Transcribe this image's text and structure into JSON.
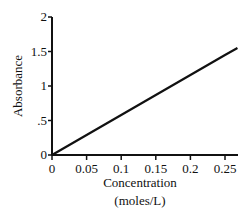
{
  "chart_data": {
    "type": "line",
    "title": "",
    "xlabel": "Concentration (moles/L)",
    "xlabel_lines": [
      "Concentration",
      "(moles/L)"
    ],
    "ylabel": "Absorbance",
    "xlim": [
      0,
      0.27
    ],
    "ylim": [
      0,
      2
    ],
    "x_ticks": [
      0,
      0.05,
      0.1,
      0.15,
      0.2,
      0.25
    ],
    "x_tick_labels": [
      "0",
      "0.05",
      "0.1",
      "0.15",
      "0.2",
      "0.25"
    ],
    "y_ticks": [
      0,
      0.5,
      1,
      1.5,
      2
    ],
    "y_tick_labels": [
      "0",
      ".5",
      "1",
      "1.5",
      "2"
    ],
    "grid": false,
    "legend": null,
    "series": [
      {
        "name": "Absorbance vs Concentration",
        "x": [
          0,
          0.05,
          0.1,
          0.15,
          0.2,
          0.25,
          0.268
        ],
        "y": [
          0,
          0.29,
          0.58,
          0.87,
          1.16,
          1.45,
          1.55
        ]
      }
    ],
    "color": "#111111"
  }
}
